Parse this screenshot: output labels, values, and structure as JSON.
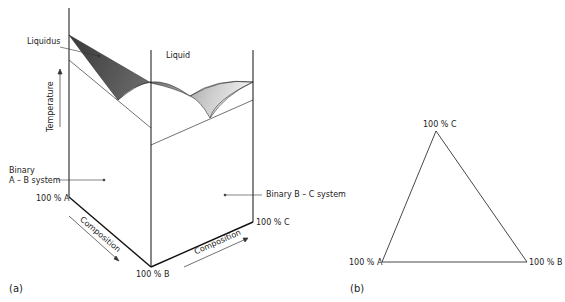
{
  "figure": {
    "panel_a": {
      "label": "(a)",
      "liquidus_label": "Liquidus",
      "liquid_label": "Liquid",
      "temperature_label": "Temperature",
      "binary_ab_line1": "Binary",
      "binary_ab_line2": "A – B system",
      "binary_bc": "Binary B – C system",
      "corner_a": "100 % A",
      "corner_b": "100 % B",
      "corner_c": "100 % C",
      "composition_ab": "Composition",
      "composition_bc": "Composition"
    },
    "panel_b": {
      "label": "(b)",
      "vertex_c": "100 % C",
      "vertex_a": "100 % A",
      "vertex_b": "100 % B"
    }
  }
}
